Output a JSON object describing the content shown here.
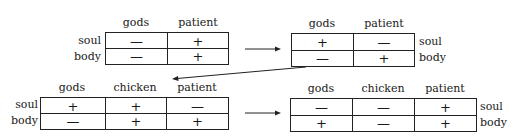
{
  "diagram": {
    "tables": [
      {
        "id": "t1",
        "columns": [
          "gods",
          "patient"
        ],
        "rows": [
          {
            "label": "soul",
            "values": [
              "—",
              "+"
            ]
          },
          {
            "label": "body",
            "values": [
              "—",
              "+"
            ]
          }
        ],
        "row_label_side": "left"
      },
      {
        "id": "t2",
        "columns": [
          "gods",
          "patient"
        ],
        "rows": [
          {
            "label": "soul",
            "values": [
              "+",
              "—"
            ]
          },
          {
            "label": "body",
            "values": [
              "—",
              "+"
            ]
          }
        ],
        "row_label_side": "right"
      },
      {
        "id": "t3",
        "columns": [
          "gods",
          "chicken",
          "patient"
        ],
        "rows": [
          {
            "label": "soul",
            "values": [
              "+",
              "+",
              "—"
            ]
          },
          {
            "label": "body",
            "values": [
              "—",
              "+",
              "+"
            ]
          }
        ],
        "row_label_side": "left"
      },
      {
        "id": "t4",
        "columns": [
          "gods",
          "chicken",
          "patient"
        ],
        "rows": [
          {
            "label": "soul",
            "values": [
              "—",
              "—",
              "+"
            ]
          },
          {
            "label": "body",
            "values": [
              "+",
              "—",
              "+"
            ]
          }
        ],
        "row_label_side": "right"
      }
    ],
    "arrows": [
      {
        "from": "t1",
        "to": "t2",
        "direction": "right"
      },
      {
        "from": "t2",
        "to": "t3",
        "direction": "down-left"
      },
      {
        "from": "t3",
        "to": "t4",
        "direction": "right"
      }
    ]
  }
}
